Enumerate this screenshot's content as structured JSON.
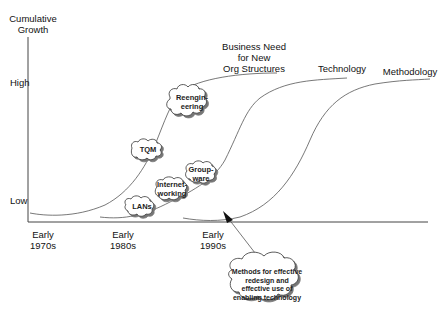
{
  "y_axis": {
    "title_line1": "Cumulative",
    "title_line2": "Growth",
    "high_label": "High",
    "low_label": "Low"
  },
  "x_axis": {
    "ticks": [
      {
        "line1": "Early",
        "line2": "1970s"
      },
      {
        "line1": "Early",
        "line2": "1980s"
      },
      {
        "line1": "Early",
        "line2": "1990s"
      }
    ]
  },
  "curves": [
    {
      "label_line1": "Business Need",
      "label_line2": "for New",
      "label_line3": "Org Structures"
    },
    {
      "label": "Technology"
    },
    {
      "label": "Methodology"
    }
  ],
  "clouds": {
    "reengineering": {
      "line1": "Reengin-",
      "line2": "eering"
    },
    "tqm": {
      "line1": "TQM"
    },
    "groupware": {
      "line1": "Group-",
      "line2": "ware"
    },
    "internetworking": {
      "line1": "Internet-",
      "line2": "working"
    },
    "lans": {
      "line1": "LANs"
    },
    "methods": {
      "line1": "Methods for effective",
      "line2": "redesign and",
      "line3": "effective use of",
      "line4": "enabling technology"
    }
  },
  "colors": {
    "line": "#555555",
    "axis": "#444444",
    "text": "#111111"
  }
}
